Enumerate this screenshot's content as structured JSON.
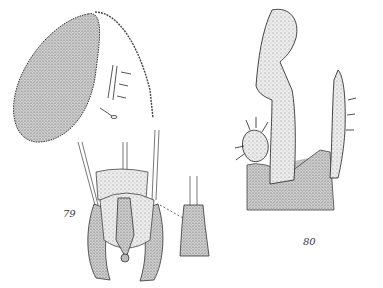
{
  "figures": [
    {
      "label": "79",
      "parts": [
        "antenna-oval-segment",
        "setae-detail",
        "genitalia-ventral-view",
        "genitalia-detail-inset"
      ]
    },
    {
      "label": "80",
      "parts": [
        "gonostylus",
        "gonocoxite-lobe",
        "basal-plate"
      ]
    }
  ],
  "colors": {
    "ink": "#2a2a2a",
    "stipple": "#8a8a8a",
    "background": "#ffffff"
  }
}
